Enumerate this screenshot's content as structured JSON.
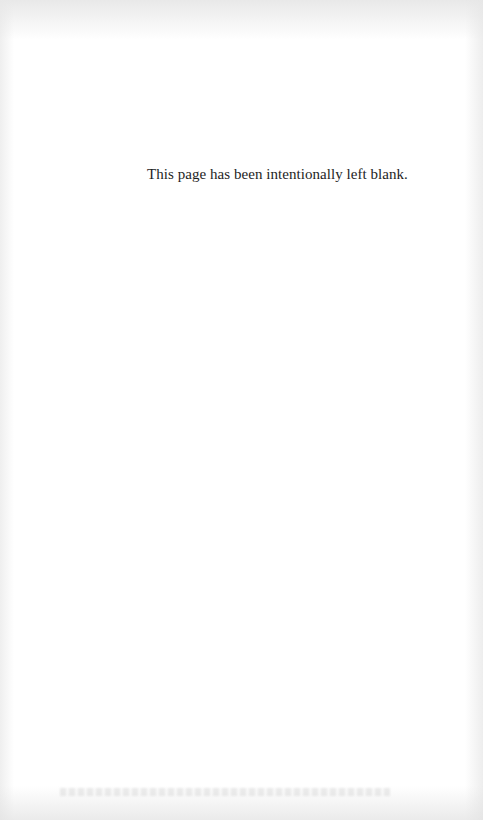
{
  "page": {
    "notice_text": "This page has been intentionally left blank."
  }
}
